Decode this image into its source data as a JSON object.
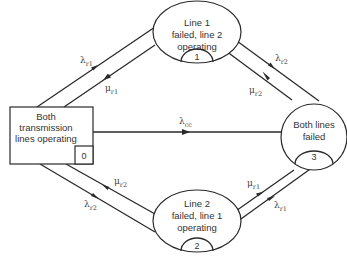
{
  "diagram": {
    "type": "state-transition (Markov) diagram",
    "colors": {
      "line": "#2a2a2a",
      "text": "#333333",
      "background": "#ffffff"
    },
    "states": [
      {
        "id": "0",
        "number": "0",
        "shape": "rectangle",
        "lines": [
          "Both",
          "transmission",
          "lines operating"
        ]
      },
      {
        "id": "1",
        "number": "1",
        "shape": "ellipse",
        "lines": [
          "Line 1",
          "failed, line 2",
          "operating"
        ]
      },
      {
        "id": "2",
        "number": "2",
        "shape": "ellipse",
        "lines": [
          "Line 2",
          "failed, line 1",
          "operating"
        ]
      },
      {
        "id": "3",
        "number": "3",
        "shape": "circle",
        "lines": [
          "Both lines",
          "failed"
        ]
      }
    ],
    "transitions": [
      {
        "from": "0",
        "to": "1",
        "symbol": "λ",
        "subscript": "r1"
      },
      {
        "from": "1",
        "to": "0",
        "symbol": "μ",
        "subscript": "r1"
      },
      {
        "from": "1",
        "to": "3",
        "symbol": "λ",
        "subscript": "r2"
      },
      {
        "from": "3",
        "to": "1",
        "symbol": "μ",
        "subscript": "r2"
      },
      {
        "from": "0",
        "to": "3",
        "symbol": "λ",
        "subscript": "cc"
      },
      {
        "from": "2",
        "to": "0",
        "symbol": "μ",
        "subscript": "r2"
      },
      {
        "from": "0",
        "to": "2",
        "symbol": "λ",
        "subscript": "r2"
      },
      {
        "from": "3",
        "to": "2",
        "symbol": "μ",
        "subscript": "r1"
      },
      {
        "from": "2",
        "to": "3",
        "symbol": "λ",
        "subscript": "r1"
      }
    ]
  }
}
